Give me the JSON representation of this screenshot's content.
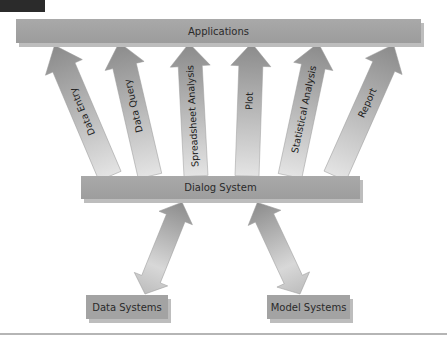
{
  "diagram": {
    "top": {
      "label": "Applications"
    },
    "middle": {
      "label": "Dialog System"
    },
    "bottom": [
      {
        "label": "Data Systems"
      },
      {
        "label": "Model Systems"
      }
    ],
    "application_arrows": [
      {
        "label": "Data Entry"
      },
      {
        "label": "Data Query"
      },
      {
        "label": "Spreadsheet Analysis"
      },
      {
        "label": "Plot"
      },
      {
        "label": "Statistical Analysis"
      },
      {
        "label": "Report"
      }
    ],
    "colors": {
      "box_fill": "#a6a6a6",
      "arrow_dark": "#8a8a8a",
      "arrow_light": "#e6e6e6",
      "corner_tab": "#2b2b2b",
      "text": "#2a2a2a"
    }
  }
}
